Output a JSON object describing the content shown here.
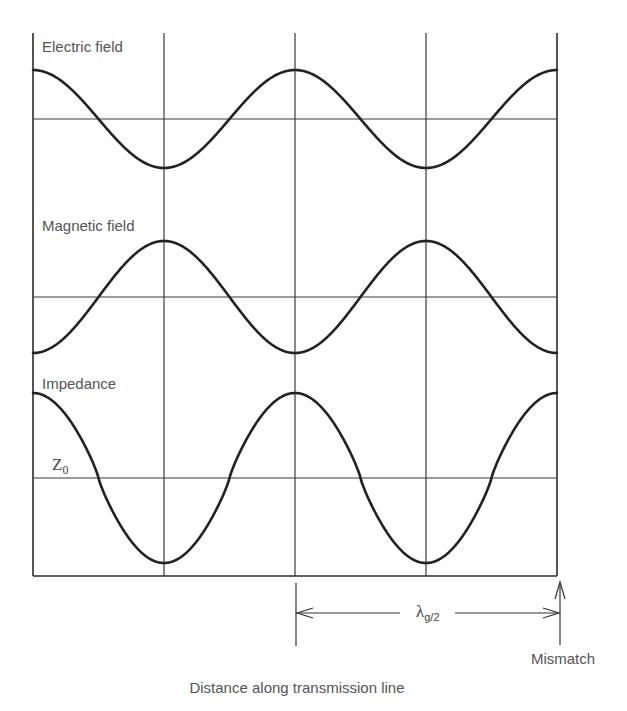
{
  "diagram": {
    "type": "standing-wave-diagram",
    "caption": "Distance along transmission line",
    "mismatch_label": "Mismatch",
    "wavelength_label": {
      "symbol": "λ",
      "subscript": "g/2"
    },
    "z0_label": {
      "symbol": "Z",
      "subscript": "0"
    },
    "panels": [
      {
        "label": "Electric field",
        "shape": "cosine",
        "phase": "max at mismatch",
        "label_y": 52,
        "center_y": 119,
        "amplitude": 49
      },
      {
        "label": "Magnetic field",
        "shape": "cosine",
        "phase": "min at mismatch",
        "label_y": 231,
        "center_y": 297,
        "amplitude": 56
      },
      {
        "label": "Impedance",
        "shape": "cosine-sharpened",
        "phase": "max at mismatch",
        "label_y": 389,
        "center_y": 478,
        "amplitude": 85
      }
    ],
    "grid": {
      "left_x": 33,
      "right_x": 557,
      "top_y": 33,
      "bottom_y": 576,
      "vertical_lines_x": [
        33,
        164,
        295,
        426,
        557
      ],
      "period_px": 262
    },
    "colors": {
      "line": "#222222",
      "grid": "#3a3a3a",
      "text": "#555555",
      "background": "#ffffff"
    }
  },
  "chart_data": {
    "type": "line",
    "title": "",
    "xlabel": "Distance along transmission line",
    "ylabel": "",
    "annotations": [
      "Mismatch",
      "λg/2",
      "Z0"
    ],
    "x": [
      0,
      0.25,
      0.5,
      0.75,
      1.0,
      1.25,
      1.5,
      1.75,
      2.0
    ],
    "x_unit": "quarter guide-wavelengths from left edge (vertical gridlines at 0, 1, 2, 3, 4 half-cycles)",
    "series": [
      {
        "name": "Electric field",
        "values": [
          1,
          0,
          -1,
          0,
          1,
          0,
          -1,
          0,
          1
        ]
      },
      {
        "name": "Magnetic field",
        "values": [
          -1,
          0,
          1,
          0,
          -1,
          0,
          1,
          0,
          -1
        ]
      },
      {
        "name": "Impedance",
        "values": [
          1,
          0,
          -1,
          0,
          1,
          0,
          -1,
          0,
          1
        ],
        "reference": "Z0"
      }
    ],
    "grid": true,
    "legend": "none (labels placed above each trace)"
  }
}
